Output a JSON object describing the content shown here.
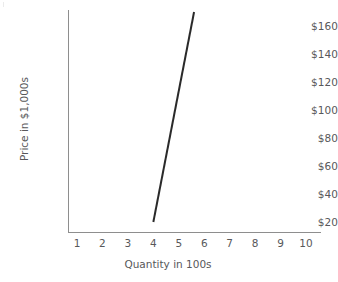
{
  "chart_data": {
    "type": "line",
    "title": "",
    "subtitle": "",
    "xlabel": "Quantity in 100s",
    "ylabel": "Price in $1,000s",
    "xlim": [
      0,
      10.5
    ],
    "ylim": [
      0,
      175
    ],
    "grid": false,
    "legend": null,
    "x_ticks": [
      1,
      2,
      3,
      4,
      5,
      6,
      7,
      8,
      9,
      10
    ],
    "x_tick_labels": [
      "1",
      "2",
      "3",
      "4",
      "5",
      "6",
      "7",
      "8",
      "9",
      "10"
    ],
    "y_ticks": [
      20,
      40,
      60,
      80,
      100,
      120,
      140,
      160
    ],
    "y_tick_labels": [
      "$20",
      "$40",
      "$60",
      "$80",
      "$100",
      "$120",
      "$140",
      "$160"
    ],
    "series": [
      {
        "name": "supply",
        "color": "#2a2a2a",
        "line_width": 2,
        "x": [
          4.0,
          5.6
        ],
        "y": [
          20,
          170
        ],
        "points": [
          {
            "x": 4.0,
            "y": 20
          },
          {
            "x": 5.6,
            "y": 170
          }
        ]
      }
    ],
    "annotations": []
  },
  "axes": {
    "y_axis_title": "Price in $1,000s",
    "x_axis_title": "Quantity in 100s",
    "axis_color": "#8e8e8e",
    "tick_label_color": "#58585a"
  },
  "colors": {
    "background": "#ffffff",
    "series_line": "#2a2a2a",
    "axis": "#8e8e8e",
    "text": "#58585a"
  }
}
